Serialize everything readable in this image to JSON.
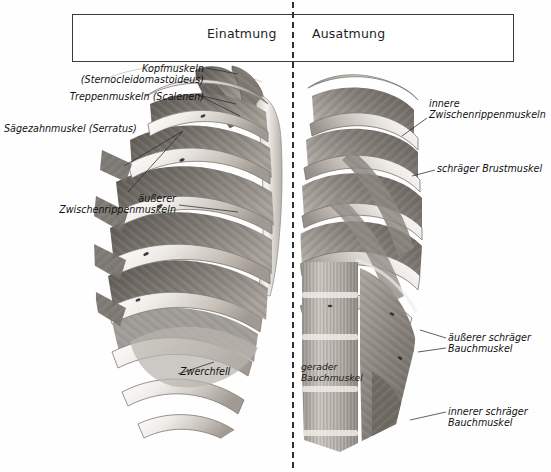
{
  "figure": {
    "title_left": "Einatmung",
    "title_right": "Ausatmung",
    "divider_color": "#2e2e2e",
    "frame_color": "#3a3a3a",
    "background": "#ffffff"
  },
  "labels_left": [
    {
      "id": "kopfmuskeln",
      "line1": "Kopfmuskeln",
      "line2": "(Sternocleidomastoideus)",
      "text": "Kopfmuskeln\n(Sternocleidomastoideus)"
    },
    {
      "id": "treppenmuskeln",
      "text": "Treppenmuskeln (Scalenen)"
    },
    {
      "id": "serratus",
      "text": "Sägezahnmuskel (Serratus)"
    },
    {
      "id": "aeussere-interkostal",
      "text": "äußerer\nZwischenrippenmuskeln"
    },
    {
      "id": "zwerchfell",
      "text": "Zwerchfell"
    }
  ],
  "labels_right": [
    {
      "id": "innere-interkostal",
      "text": "innere\nZwischenrippenmuskeln"
    },
    {
      "id": "schraeger-brustmuskel",
      "text": "schräger Brustmuskel"
    },
    {
      "id": "aeusserer-schraeger-bauch",
      "text": "äußerer schräger\nBauchmuskel"
    },
    {
      "id": "innerer-schraeger-bauch",
      "text": "innerer schräger\nBauchmuskel"
    }
  ],
  "labels_overlay": [
    {
      "id": "gerader-bauchmuskel",
      "text": "gerader\nBauchmuskel"
    }
  ],
  "illustration": {
    "description": "Grayscale anatomical drawing of the human rib cage and respiratory muscles, left half showing inhalation muscles, right half showing exhalation muscles",
    "palette": {
      "bone_light": "#f2f0ee",
      "bone_mid": "#cfcac4",
      "bone_shadow": "#9a948d",
      "muscle_dark": "#6f6b66",
      "muscle_mid": "#8d8882",
      "muscle_light": "#b4afa9",
      "outline": "#4a4642"
    }
  }
}
